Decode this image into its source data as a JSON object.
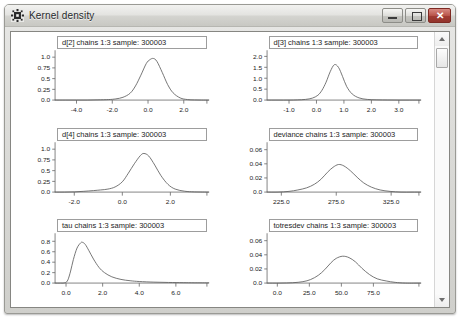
{
  "window": {
    "title": "Kernel density",
    "icon": "app-icon",
    "buttons": {
      "minimize": "minimize-icon",
      "restore": "restore-icon",
      "close": "✕"
    }
  },
  "scrollbar": {
    "up_arrow": "scroll-up-arrow",
    "down_arrow": "scroll-down-arrow",
    "thumb": "scroll-thumb"
  },
  "chart_data": [
    {
      "id": "d2",
      "type": "line",
      "title": "d[2] chains 1:3 sample: 300003",
      "xlabel": "",
      "ylabel": "",
      "xlim": [
        -5.2,
        3.4
      ],
      "ylim": [
        0.0,
        1.12
      ],
      "xticks": [
        -4.0,
        -2.0,
        0.0,
        2.0
      ],
      "xticklabels": [
        "-4.0",
        "-2.0",
        "0.0",
        "2.0"
      ],
      "yticks": [
        0.0,
        0.25,
        0.5,
        0.75,
        1.0
      ],
      "yticklabels": [
        "0.0",
        "0.25",
        "0.5",
        "0.75",
        "1.0"
      ],
      "grid": false,
      "legend": "none",
      "peak_x": 0.3,
      "peak_y": 0.97,
      "sigma": 0.42,
      "skew": 0.0,
      "x": [
        -5.2,
        -4.6,
        -4.0,
        -3.4,
        -2.8,
        -2.2,
        -1.8,
        -1.4,
        -1.0,
        -0.7,
        -0.4,
        -0.1,
        0.1,
        0.3,
        0.5,
        0.8,
        1.1,
        1.4,
        1.8,
        2.2,
        2.6,
        3.0,
        3.4
      ],
      "y": [
        0.0,
        0.0,
        0.0,
        0.0,
        0.005,
        0.012,
        0.028,
        0.065,
        0.16,
        0.33,
        0.58,
        0.85,
        0.94,
        0.97,
        0.9,
        0.64,
        0.36,
        0.17,
        0.05,
        0.012,
        0.003,
        0.0,
        0.0
      ]
    },
    {
      "id": "d3",
      "type": "line",
      "title": "d[3] chains 1:3 sample: 300003",
      "xlabel": "",
      "ylabel": "",
      "xlim": [
        -1.8,
        3.8
      ],
      "ylim": [
        0.0,
        2.2
      ],
      "xticks": [
        -1.0,
        0.0,
        1.0,
        2.0,
        3.0
      ],
      "xticklabels": [
        "-1.0",
        "0.0",
        "1.0",
        "2.0",
        "3.0"
      ],
      "yticks": [
        0.0,
        0.5,
        1.0,
        1.5,
        2.0
      ],
      "yticklabels": [
        "0.0",
        "0.5",
        "1.0",
        "1.5",
        "2.0"
      ],
      "grid": false,
      "legend": "none",
      "peak_x": 0.65,
      "peak_y": 1.62,
      "sigma": 0.25,
      "skew": 0.0,
      "x": [
        -1.8,
        -1.4,
        -1.0,
        -0.7,
        -0.4,
        -0.15,
        0.05,
        0.2,
        0.35,
        0.5,
        0.65,
        0.8,
        0.95,
        1.1,
        1.3,
        1.55,
        1.85,
        2.2,
        2.6,
        3.0,
        3.4,
        3.8
      ],
      "y": [
        0.0,
        0.0,
        0.0,
        0.008,
        0.03,
        0.09,
        0.22,
        0.45,
        0.82,
        1.3,
        1.62,
        1.5,
        1.08,
        0.62,
        0.28,
        0.1,
        0.03,
        0.01,
        0.004,
        0.0,
        0.0,
        0.0
      ]
    },
    {
      "id": "d4",
      "type": "line",
      "title": "d[4] chains 1:3 sample: 300003",
      "xlabel": "",
      "ylabel": "",
      "xlim": [
        -2.8,
        3.6
      ],
      "ylim": [
        0.0,
        1.12
      ],
      "xticks": [
        -2.0,
        0.0,
        2.0
      ],
      "xticklabels": [
        "-2.0",
        "0.0",
        "2.0"
      ],
      "yticks": [
        0.0,
        0.25,
        0.5,
        0.75,
        1.0
      ],
      "yticklabels": [
        "0.0",
        "0.25",
        "0.5",
        "0.75",
        "1.0"
      ],
      "grid": false,
      "legend": "none",
      "peak_x": 0.9,
      "peak_y": 0.9,
      "sigma": 0.45,
      "skew": 0.0,
      "x": [
        -2.8,
        -2.4,
        -2.0,
        -1.6,
        -1.2,
        -0.9,
        -0.6,
        -0.3,
        0.0,
        0.25,
        0.5,
        0.75,
        0.9,
        1.1,
        1.35,
        1.6,
        1.9,
        2.2,
        2.6,
        3.0,
        3.6
      ],
      "y": [
        0.0,
        0.0,
        0.005,
        0.018,
        0.035,
        0.05,
        0.07,
        0.12,
        0.24,
        0.44,
        0.66,
        0.85,
        0.9,
        0.84,
        0.63,
        0.39,
        0.18,
        0.07,
        0.02,
        0.005,
        0.0
      ]
    },
    {
      "id": "deviance",
      "type": "line",
      "title": "deviance chains 1:3 sample: 300003",
      "xlabel": "",
      "ylabel": "",
      "xlim": [
        212.0,
        352.0
      ],
      "ylim": [
        0.0,
        0.068
      ],
      "xticks": [
        225.0,
        275.0,
        325.0
      ],
      "xticklabels": [
        "225.0",
        "275.0",
        "325.0"
      ],
      "yticks": [
        0.0,
        0.02,
        0.04,
        0.06
      ],
      "yticklabels": [
        "0.0",
        "0.02",
        "0.04",
        "0.06"
      ],
      "grid": false,
      "legend": "none",
      "peak_x": 277.0,
      "peak_y": 0.039,
      "sigma": 11.0,
      "skew": 0.0,
      "x": [
        212,
        222,
        232,
        240,
        248,
        255,
        261,
        267,
        272,
        277,
        282,
        288,
        294,
        300,
        307,
        315,
        324,
        334,
        344,
        352
      ],
      "y": [
        0.0,
        0.0,
        0.001,
        0.003,
        0.006,
        0.011,
        0.018,
        0.028,
        0.035,
        0.039,
        0.037,
        0.03,
        0.021,
        0.013,
        0.007,
        0.003,
        0.001,
        0.0,
        0.0,
        0.0
      ]
    },
    {
      "id": "tau",
      "type": "line",
      "title": "tau chains 1:3 sample: 300003",
      "xlabel": "",
      "ylabel": "",
      "xlim": [
        -0.6,
        7.8
      ],
      "ylim": [
        0.0,
        0.92
      ],
      "xticks": [
        0.0,
        2.0,
        4.0,
        6.0
      ],
      "xticklabels": [
        "0.0",
        "2.0",
        "4.0",
        "6.0"
      ],
      "yticks": [
        0.0,
        0.2,
        0.4,
        0.6,
        0.8
      ],
      "yticklabels": [
        "0.0",
        "0.2",
        "0.4",
        "0.6",
        "0.8"
      ],
      "grid": false,
      "legend": "none",
      "peak_x": 0.9,
      "peak_y": 0.78,
      "sigma": 0.6,
      "skew": 1.0,
      "x": [
        -0.6,
        -0.3,
        -0.05,
        0.1,
        0.25,
        0.4,
        0.6,
        0.8,
        0.9,
        1.05,
        1.25,
        1.5,
        1.8,
        2.1,
        2.5,
        3.0,
        3.5,
        4.0,
        4.8,
        5.6,
        6.4,
        7.0,
        7.8
      ],
      "y": [
        0.0,
        0.0,
        0.005,
        0.06,
        0.23,
        0.45,
        0.67,
        0.77,
        0.78,
        0.74,
        0.62,
        0.46,
        0.3,
        0.2,
        0.12,
        0.07,
        0.045,
        0.03,
        0.018,
        0.012,
        0.008,
        0.006,
        0.005
      ]
    },
    {
      "id": "totresdev",
      "type": "line",
      "title": "totresdev chains 1:3 sample: 300003",
      "xlabel": "",
      "ylabel": "",
      "xlim": [
        -8.0,
        112.0
      ],
      "ylim": [
        0.0,
        0.068
      ],
      "xticks": [
        0.0,
        25.0,
        50.0,
        75.0
      ],
      "xticklabels": [
        "0.0",
        "25.0",
        "50.0",
        "75.0"
      ],
      "yticks": [
        0.0,
        0.02,
        0.04,
        0.06
      ],
      "yticklabels": [
        "0.0",
        "0.02",
        "0.04",
        "0.06"
      ],
      "grid": false,
      "legend": "none",
      "peak_x": 51.0,
      "peak_y": 0.038,
      "sigma": 10.5,
      "skew": 0.0,
      "x": [
        -8,
        2,
        12,
        20,
        26,
        32,
        37,
        42,
        46,
        51,
        56,
        61,
        66,
        72,
        78,
        85,
        92,
        100,
        112
      ],
      "y": [
        0.0,
        0.0,
        0.0005,
        0.002,
        0.005,
        0.011,
        0.019,
        0.029,
        0.035,
        0.038,
        0.036,
        0.03,
        0.021,
        0.012,
        0.006,
        0.003,
        0.001,
        0.0,
        0.0
      ]
    }
  ]
}
